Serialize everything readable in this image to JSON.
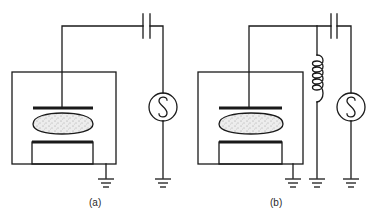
{
  "figure": {
    "panels": [
      {
        "id": "a",
        "label": "(a)",
        "description": "Capacitively coupled plasma chamber driven by RF source through blocking capacitor",
        "components": [
          "chamber",
          "top-electrode",
          "plasma",
          "bottom-electrode",
          "blocking-capacitor",
          "rf-source",
          "ground",
          "ground"
        ]
      },
      {
        "id": "b",
        "label": "(b)",
        "description": "Same chamber with inductor shunt to ground added in parallel",
        "components": [
          "chamber",
          "top-electrode",
          "plasma",
          "bottom-electrode",
          "blocking-capacitor",
          "inductor",
          "rf-source",
          "ground",
          "ground",
          "ground"
        ]
      }
    ],
    "source_symbol": "S",
    "colors": {
      "line": "#1a1a1a",
      "plasma_fill": "#ebebeb",
      "background": "#ffffff"
    }
  }
}
